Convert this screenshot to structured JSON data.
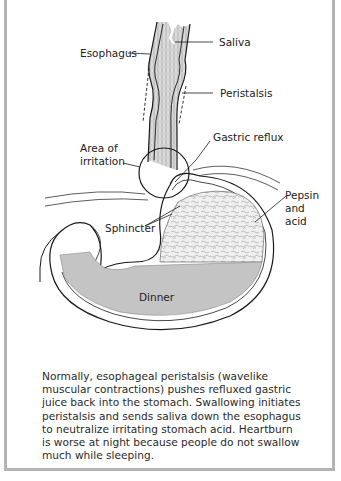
{
  "figure": {
    "labels": {
      "saliva": "Saliva",
      "esophagus": "Esophagus",
      "peristalsis": "Peristalsis",
      "gastric_reflux": "Gastric reflux",
      "area_of_irritation_line1": "Area of",
      "area_of_irritation_line2": "irritation",
      "pepsin_line1": "Pepsin",
      "pepsin_line2": "and",
      "pepsin_line3": "acid",
      "sphincter": "Sphincter",
      "dinner": "Dinner"
    },
    "caption": "Normally, esophageal peristalsis (wavelike muscular contractions) pushes refluxed gastric juice back into the stomach. Swallowing initiates peristalsis and sends saliva down the esophagus to neutralize irritating stomach acid. Heartburn is worse at night because people do not swallow much while sleeping.",
    "colors": {
      "frame_border": "#b4b4b4",
      "stomach_contents": "#c4c4c4",
      "outline": "#1a1a1a"
    }
  }
}
